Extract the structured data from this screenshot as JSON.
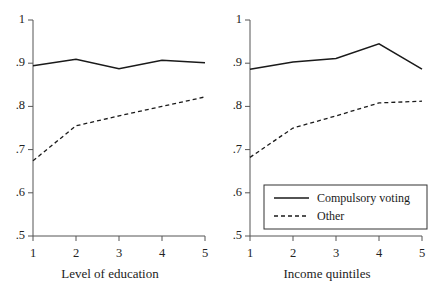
{
  "figure": {
    "background": "#ffffff",
    "line_color": "#1a1a1a"
  },
  "legend": {
    "position": "bottom-right of right panel",
    "entries": [
      {
        "label": "Compulsory voting",
        "style": "solid"
      },
      {
        "label": "Other",
        "style": "dashed"
      }
    ]
  },
  "chart_data": [
    {
      "type": "line",
      "panel": "left",
      "title": "",
      "xlabel": "Level of education",
      "ylabel": "",
      "x": [
        1,
        2,
        3,
        4,
        5
      ],
      "categories": [
        "1",
        "2",
        "3",
        "4",
        "5"
      ],
      "xtick_labels": [
        "1",
        "2",
        "3",
        "4",
        "5"
      ],
      "ytick_labels": [
        "1",
        ".9",
        ".8",
        ".7",
        ".6",
        ".5"
      ],
      "ytick_values": [
        1,
        0.9,
        0.8,
        0.7,
        0.6,
        0.5
      ],
      "xlim": [
        1,
        5
      ],
      "ylim": [
        0.5,
        1
      ],
      "grid": false,
      "series": [
        {
          "name": "Compulsory voting",
          "style": "solid",
          "values": [
            0.894,
            0.909,
            0.887,
            0.907,
            0.901
          ]
        },
        {
          "name": "Other",
          "style": "dashed",
          "values": [
            0.674,
            0.755,
            0.778,
            0.8,
            0.822
          ]
        }
      ]
    },
    {
      "type": "line",
      "panel": "right",
      "title": "",
      "xlabel": "Income quintiles",
      "ylabel": "",
      "x": [
        1,
        2,
        3,
        4,
        5
      ],
      "categories": [
        "1",
        "2",
        "3",
        "4",
        "5"
      ],
      "xtick_labels": [
        "1",
        "2",
        "3",
        "4",
        "5"
      ],
      "ytick_labels": [
        "1",
        ".9",
        ".8",
        ".7",
        ".6",
        ".5"
      ],
      "ytick_values": [
        1,
        0.9,
        0.8,
        0.7,
        0.6,
        0.5
      ],
      "xlim": [
        1,
        5
      ],
      "ylim": [
        0.5,
        1
      ],
      "grid": false,
      "series": [
        {
          "name": "Compulsory voting",
          "style": "solid",
          "values": [
            0.886,
            0.903,
            0.911,
            0.945,
            0.886
          ]
        },
        {
          "name": "Other",
          "style": "dashed",
          "values": [
            0.682,
            0.75,
            0.778,
            0.808,
            0.812
          ]
        }
      ]
    }
  ]
}
